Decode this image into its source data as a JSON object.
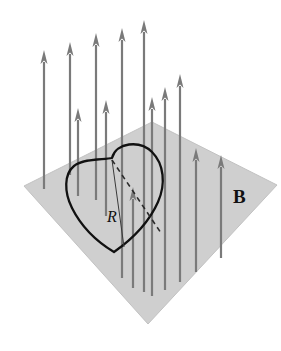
{
  "figure": {
    "type": "physics-diagram",
    "background_color": "#ffffff",
    "plane": {
      "name": "field-plane",
      "fill_color": "#cfcfcf",
      "edge_color": "#c2c2c2",
      "points": "24,186 152,122 277,185 148,324"
    },
    "loop": {
      "name": "heart-loop",
      "stroke_color": "#111111",
      "stroke_width": 2.3,
      "path": "M 112,158 C 116,142 140,140 152,152 C 164,164 166,184 158,202 C 150,220 134,238 114,252 C 94,240 80,224 72,208 C 64,192 64,174 74,166 C 84,158 104,160 112,158 Z"
    },
    "radius_solid_line": {
      "name": "radius-solid-line",
      "stroke_color": "#3a3a3a",
      "stroke_width": 1.0,
      "x1": 112,
      "y1": 160,
      "x2": 124,
      "y2": 247
    },
    "radius_dashed_line": {
      "name": "radius-dashed-line",
      "stroke_color": "#2b2b2b",
      "stroke_width": 1.6,
      "dash": "5,4",
      "x1": 112,
      "y1": 160,
      "x2": 161,
      "y2": 233
    },
    "arrow_style": {
      "shaft_color": "#7a7a7a",
      "head_color": "#7a7a7a",
      "shaft_width": 2.2,
      "head_width": 7,
      "head_length": 14
    },
    "arrows": [
      {
        "name": "field-arrow-1",
        "x": 44,
        "tail_y": 189,
        "tip_y": 50
      },
      {
        "name": "field-arrow-2",
        "x": 70,
        "tail_y": 175,
        "tip_y": 42
      },
      {
        "name": "field-arrow-3",
        "x": 78,
        "tail_y": 196,
        "tip_y": 108
      },
      {
        "name": "field-arrow-4",
        "x": 96,
        "tail_y": 200,
        "tip_y": 33
      },
      {
        "name": "field-arrow-5",
        "x": 106,
        "tail_y": 216,
        "tip_y": 100
      },
      {
        "name": "field-arrow-6",
        "x": 122,
        "tail_y": 278,
        "tip_y": 28
      },
      {
        "name": "field-arrow-7",
        "x": 133,
        "tail_y": 288,
        "tip_y": 187
      },
      {
        "name": "field-arrow-8",
        "x": 144,
        "tail_y": 292,
        "tip_y": 20
      },
      {
        "name": "field-arrow-9",
        "x": 152,
        "tail_y": 296,
        "tip_y": 97
      },
      {
        "name": "field-arrow-10",
        "x": 165,
        "tail_y": 290,
        "tip_y": 87
      },
      {
        "name": "field-arrow-11",
        "x": 180,
        "tail_y": 282,
        "tip_y": 74
      },
      {
        "name": "field-arrow-12",
        "x": 196,
        "tail_y": 272,
        "tip_y": 148
      },
      {
        "name": "field-arrow-13",
        "x": 221,
        "tail_y": 258,
        "tip_y": 155
      }
    ],
    "labels": [
      {
        "name": "field-label-B",
        "text": "B",
        "x": 233,
        "y": 203,
        "font_size": 19,
        "font_weight": "bold",
        "font_style": "normal",
        "color": "#111111"
      },
      {
        "name": "radius-label-R",
        "text": "R",
        "x": 107,
        "y": 222,
        "font_size": 16,
        "font_weight": "normal",
        "font_style": "italic",
        "color": "#111111"
      }
    ]
  }
}
